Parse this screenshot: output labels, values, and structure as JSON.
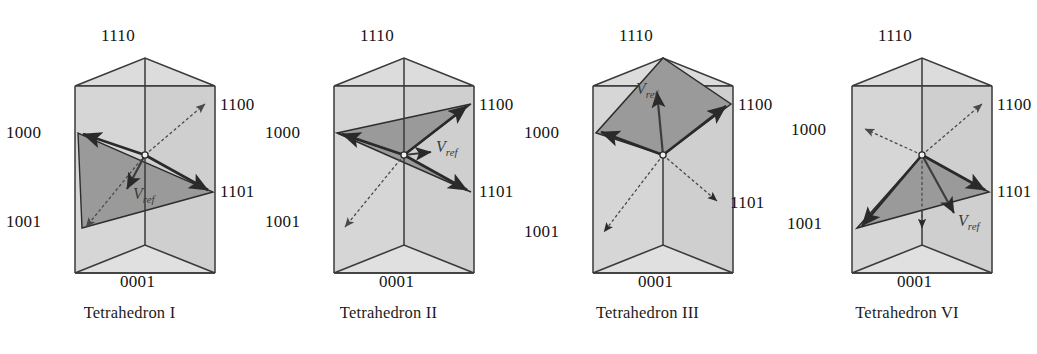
{
  "figure_set": {
    "vector_label": "V",
    "vector_subscript": "ref",
    "figures": [
      {
        "caption": "Tetrahedron I",
        "labels": {
          "top": "1110",
          "upper_right": "1100",
          "lower_right": "1101",
          "upper_left": "1000",
          "lower_left": "1001",
          "bottom": "0001"
        },
        "shaded_region": "triangle-1000-1001-1101",
        "vref_direction": "down-left",
        "solid_arrows": [
          "1000",
          "1101"
        ],
        "dashed_arrows": [
          "1100",
          "1001"
        ]
      },
      {
        "caption": "Tetrahedron II",
        "labels": {
          "top": "1110",
          "upper_right": "1100",
          "lower_right": "1101",
          "upper_left": "1000",
          "lower_left": "1001",
          "bottom": "0001"
        },
        "shaded_region": "butterfly-1000-1100-1101",
        "vref_direction": "right",
        "solid_arrows": [
          "1000",
          "1100",
          "1101"
        ],
        "dashed_arrows": [
          "1001"
        ]
      },
      {
        "caption": "Tetrahedron III",
        "labels": {
          "top": "1110",
          "upper_right": "1100",
          "lower_right": "1101",
          "upper_left": "1000",
          "lower_left": "1001",
          "bottom": "0001"
        },
        "shaded_region": "kite-1110-1000-1100",
        "vref_direction": "up",
        "solid_arrows": [
          "1000",
          "1100"
        ],
        "dashed_arrows": [
          "1110",
          "1101",
          "1001"
        ]
      },
      {
        "caption": "Tetrahedron VI",
        "labels": {
          "top": "1110",
          "upper_right": "1100",
          "lower_right": "1101",
          "upper_left": "1000",
          "lower_left": "1001",
          "bottom": "0001"
        },
        "shaded_region": "triangle-origin-1001-1101",
        "vref_direction": "down-right",
        "solid_arrows": [
          "1001",
          "1101"
        ],
        "dashed_arrows": [
          "1000",
          "1100",
          "0001"
        ]
      }
    ],
    "colors": {
      "prism_fill": "#d6d6d6",
      "prism_side_fill": "#cfcfcf",
      "shade_fill": "#9a9a9a",
      "outline": "#3a3a3a",
      "arrow_solid": "#2a2a2a",
      "arrow_dashed": "#5a5a5a"
    }
  }
}
